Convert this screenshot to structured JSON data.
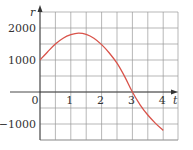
{
  "chart_data": {
    "type": "line",
    "title": "",
    "xlabel": "t",
    "ylabel": "r",
    "xlim": [
      0,
      4.5
    ],
    "ylim": [
      -1500,
      2500
    ],
    "grid": true,
    "grid_x_step": 0.5,
    "grid_y_step": 500,
    "x_ticks": [
      {
        "value": 0,
        "label": "0"
      },
      {
        "value": 1,
        "label": "1"
      },
      {
        "value": 2,
        "label": "2"
      },
      {
        "value": 3,
        "label": "3"
      },
      {
        "value": 4,
        "label": "4"
      }
    ],
    "y_ticks": [
      {
        "value": 2000,
        "label": "2000"
      },
      {
        "value": 1000,
        "label": "1000"
      },
      {
        "value": -1000,
        "label": "−1000"
      }
    ],
    "legend": null,
    "series": [
      {
        "name": "r(t)",
        "color": "#d9534a",
        "x": [
          0,
          0.25,
          0.5,
          0.75,
          1,
          1.25,
          1.5,
          1.75,
          2,
          2.25,
          2.5,
          2.75,
          3,
          3.25,
          3.5,
          3.75,
          4
        ],
        "values": [
          1000,
          1260,
          1500,
          1680,
          1790,
          1840,
          1800,
          1680,
          1480,
          1220,
          900,
          480,
          0,
          -400,
          -720,
          -980,
          -1200
        ]
      }
    ]
  },
  "colors": {
    "grid": "#9a9a9a",
    "axis": "#333333",
    "curve": "#d9534a"
  }
}
